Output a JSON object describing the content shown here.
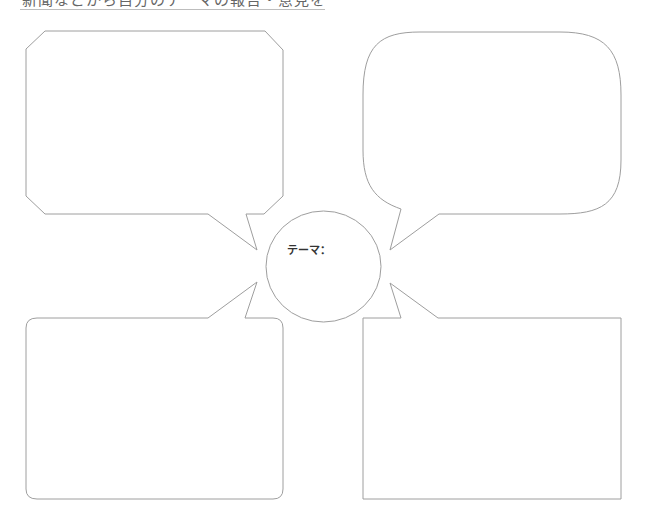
{
  "header": {
    "title": "新聞などから自分のテーマの報告・意見を書く"
  },
  "center": {
    "theme_label": "テーマ："
  },
  "bubbles": [
    {
      "id": "top-left",
      "shape": "clipped-octagon",
      "text": ""
    },
    {
      "id": "top-right",
      "shape": "rounded-cloud",
      "text": ""
    },
    {
      "id": "bottom-left",
      "shape": "rounded-rect",
      "text": ""
    },
    {
      "id": "bottom-right",
      "shape": "rect",
      "text": ""
    }
  ],
  "colors": {
    "stroke": "#9e9e9e",
    "title_text": "#666666",
    "theme_text": "#333333"
  }
}
